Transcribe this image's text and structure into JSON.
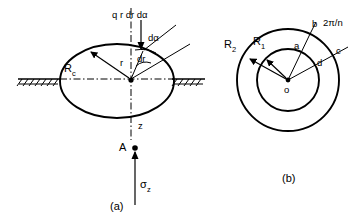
{
  "figure": {
    "title_text": "",
    "captions": {
      "a": "(a)",
      "b": "(b)"
    },
    "colors": {
      "line": "#000000",
      "background": "#ffffff"
    }
  },
  "panel_a": {
    "name": "circular-loaded-area-elevation",
    "labels": {
      "load_element": "q r dr dα",
      "d_alpha": "dα",
      "d_r": "dr",
      "radius_r": "r",
      "contact_radius": "R",
      "contact_radius_sub": "c",
      "depth": "z",
      "point": "A",
      "stress": "σ",
      "stress_sub": "z"
    },
    "geometry": {
      "ellipse_center": [
        117,
        81
      ],
      "ellipse_rx": 57,
      "ellipse_ry": 37,
      "ground_level_y": 79,
      "point_A": [
        135,
        148
      ],
      "stress_arrow_from": [
        135,
        205
      ],
      "stress_arrow_to": [
        135,
        150
      ]
    }
  },
  "panel_b": {
    "name": "concentric-ring-plan-view",
    "labels": {
      "outer_radius": "R",
      "outer_radius_sub": "2",
      "inner_radius": "R",
      "inner_radius_sub": "1",
      "vertex_a": "a",
      "vertex_b": "b",
      "vertex_c": "c",
      "vertex_d": "d",
      "center": "o",
      "sector_angle": "2π/n"
    },
    "geometry": {
      "center": [
        288,
        80
      ],
      "outer_circle_r": 51,
      "inner_circle_r": 31
    }
  }
}
